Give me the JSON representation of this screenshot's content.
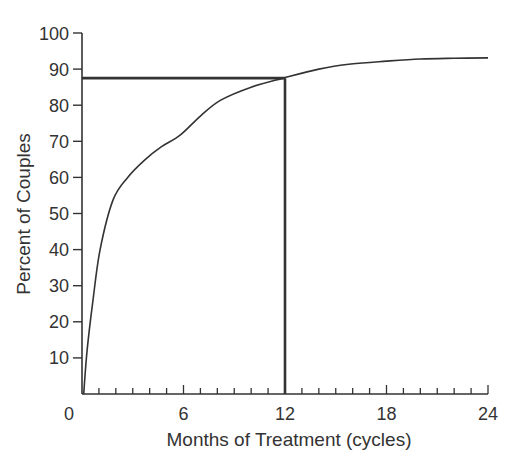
{
  "chart_data": {
    "type": "line",
    "title": "",
    "xlabel": "Months of Treatment (cycles)",
    "ylabel": "Percent of Couples",
    "xlim": [
      0,
      24
    ],
    "ylim": [
      0,
      100
    ],
    "x_ticks_major": [
      0,
      6,
      12,
      18,
      24
    ],
    "x_tick_labels": [
      "0",
      "6",
      "12",
      "18",
      "24"
    ],
    "x_ticks_minor_step": 1,
    "y_ticks": [
      10,
      20,
      30,
      40,
      50,
      60,
      70,
      80,
      90,
      100
    ],
    "y_tick_labels": [
      "10",
      "20",
      "30",
      "40",
      "50",
      "60",
      "70",
      "80",
      "90",
      "100"
    ],
    "grid": false,
    "legend": null,
    "series": [
      {
        "name": "Cumulative pregnancy rate",
        "x": [
          0.1,
          0.3,
          0.65,
          1.07,
          1.83,
          2.7,
          3.7,
          4.7,
          5.8,
          7.0,
          8.2,
          10.0,
          11.9,
          14.0,
          15.9,
          18.0,
          20.0,
          22.0,
          24.0
        ],
        "y": [
          0,
          12,
          26,
          40,
          53.7,
          60,
          64.8,
          68.5,
          71.7,
          77,
          81.4,
          85,
          87.5,
          90,
          91.4,
          92.2,
          92.8,
          93.0,
          93.1
        ]
      }
    ],
    "annotations": [
      {
        "type": "hline",
        "y": 87.5,
        "x_from": 0,
        "x_to": 12,
        "label": ""
      },
      {
        "type": "vline",
        "x": 12,
        "y_from": 0,
        "y_to": 87.5,
        "label": ""
      }
    ]
  },
  "colors": {
    "line": "#333333",
    "text": "#333333",
    "background": "#ffffff"
  }
}
